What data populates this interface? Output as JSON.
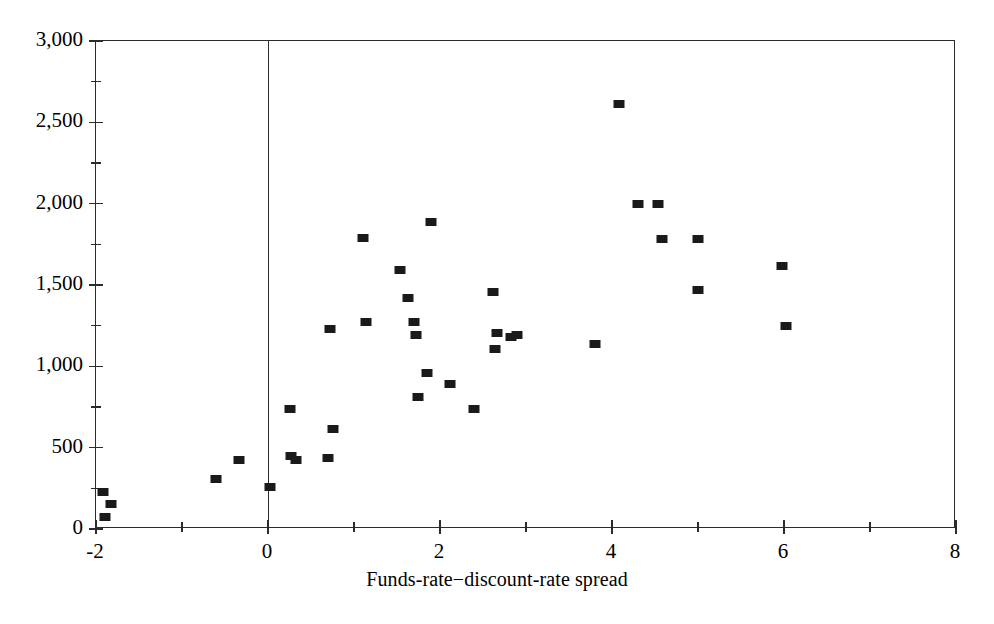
{
  "chart_data": {
    "type": "scatter",
    "title": "",
    "xlabel": "Funds-rate−discount-rate spread",
    "ylabel": "",
    "xlim": [
      -2,
      8
    ],
    "ylim": [
      0,
      3000
    ],
    "xticks": [
      -2,
      0,
      2,
      4,
      6,
      8
    ],
    "xtick_labels": [
      "-2",
      "0",
      "2",
      "4",
      "6",
      "8"
    ],
    "xminor_ticks": [
      -1,
      1,
      3,
      5,
      7
    ],
    "yticks": [
      0,
      500,
      1000,
      1500,
      2000,
      2500,
      3000
    ],
    "ytick_labels": [
      "0",
      "500",
      "1,000",
      "1,500",
      "2,000",
      "2,500",
      "3,000"
    ],
    "yminor_ticks": [
      250,
      750,
      1250,
      1750,
      2250,
      2750
    ],
    "grid": false,
    "legend": null,
    "marker": "filled-square",
    "marker_color": "#1a1a1a",
    "reference_lines": [
      {
        "orientation": "vertical",
        "x": 0,
        "color": "#2b2b2b"
      }
    ],
    "points": [
      {
        "x": -1.92,
        "y": 230
      },
      {
        "x": -1.82,
        "y": 155
      },
      {
        "x": -1.9,
        "y": 75
      },
      {
        "x": -0.6,
        "y": 310
      },
      {
        "x": -0.34,
        "y": 425
      },
      {
        "x": 0.02,
        "y": 260
      },
      {
        "x": 0.26,
        "y": 735
      },
      {
        "x": 0.27,
        "y": 450
      },
      {
        "x": 0.33,
        "y": 425
      },
      {
        "x": 0.7,
        "y": 435
      },
      {
        "x": 0.72,
        "y": 1230
      },
      {
        "x": 0.76,
        "y": 615
      },
      {
        "x": 1.1,
        "y": 1790
      },
      {
        "x": 1.14,
        "y": 1270
      },
      {
        "x": 1.54,
        "y": 1590
      },
      {
        "x": 1.63,
        "y": 1420
      },
      {
        "x": 1.7,
        "y": 1270
      },
      {
        "x": 1.72,
        "y": 1195
      },
      {
        "x": 1.74,
        "y": 810
      },
      {
        "x": 1.9,
        "y": 1885
      },
      {
        "x": 1.85,
        "y": 960
      },
      {
        "x": 2.12,
        "y": 890
      },
      {
        "x": 2.4,
        "y": 735
      },
      {
        "x": 2.62,
        "y": 1455
      },
      {
        "x": 2.66,
        "y": 1205
      },
      {
        "x": 2.64,
        "y": 1105
      },
      {
        "x": 2.82,
        "y": 1180
      },
      {
        "x": 2.9,
        "y": 1190
      },
      {
        "x": 3.8,
        "y": 1135
      },
      {
        "x": 4.08,
        "y": 2610
      },
      {
        "x": 4.3,
        "y": 2000
      },
      {
        "x": 4.54,
        "y": 1995
      },
      {
        "x": 4.58,
        "y": 1785
      },
      {
        "x": 5.0,
        "y": 1780
      },
      {
        "x": 5.0,
        "y": 1470
      },
      {
        "x": 5.98,
        "y": 1615
      },
      {
        "x": 6.02,
        "y": 1250
      }
    ]
  },
  "axis": {
    "x_title": "Funds-rate−discount-rate spread"
  }
}
